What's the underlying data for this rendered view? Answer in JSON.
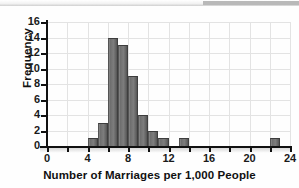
{
  "figure": {
    "background_color": "#ffffff",
    "bar_color": "#6f6f6f",
    "grid_color": "#e3e3e3",
    "axis_color": "#111111"
  },
  "chart_data": {
    "type": "bar",
    "title": "",
    "subtitle": "",
    "xlabel": "Number of Marriages per 1,000 People",
    "ylabel": "Frequency",
    "xlim": [
      0,
      24
    ],
    "ylim": [
      0,
      16
    ],
    "grid": true,
    "legend": null,
    "bin_width": 1,
    "x_tick_labels": [
      "0",
      "4",
      "8",
      "12",
      "16",
      "20",
      "24"
    ],
    "x_tick_values": [
      0,
      4,
      8,
      12,
      16,
      20,
      24
    ],
    "x_minor_tick_values": [
      2,
      6,
      10,
      14,
      18,
      22
    ],
    "y_tick_labels": [
      "0",
      "2",
      "4",
      "6",
      "8",
      "10",
      "12",
      "14",
      "16"
    ],
    "y_tick_values": [
      0,
      2,
      4,
      6,
      8,
      10,
      12,
      14,
      16
    ],
    "bins": [
      {
        "left": 4,
        "right": 5,
        "value": 1
      },
      {
        "left": 5,
        "right": 6,
        "value": 3
      },
      {
        "left": 6,
        "right": 7,
        "value": 14
      },
      {
        "left": 7,
        "right": 8,
        "value": 13
      },
      {
        "left": 8,
        "right": 9,
        "value": 9
      },
      {
        "left": 9,
        "right": 10,
        "value": 4
      },
      {
        "left": 10,
        "right": 11,
        "value": 2
      },
      {
        "left": 11,
        "right": 12,
        "value": 1
      },
      {
        "left": 13,
        "right": 14,
        "value": 1
      },
      {
        "left": 22,
        "right": 23,
        "value": 1
      }
    ]
  }
}
